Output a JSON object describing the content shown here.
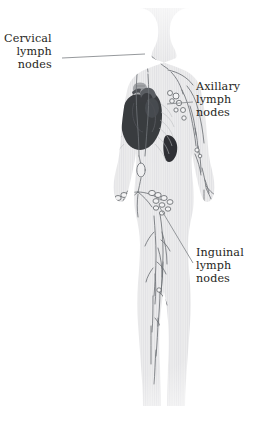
{
  "diagram": {
    "background_color": "#ffffff",
    "body_fill_color": "#ececed",
    "body_stripe_color": "#e2e2e4",
    "vessel_color": "#6f7377",
    "node_stroke_color": "#6f7377",
    "node_fill_color": "#f2f2f3",
    "organ_heart_color": "#3a3c40",
    "organ_spleen_color": "#2f3135",
    "leader_line_color": "#8a8d91",
    "text_color": "#1f1f22"
  },
  "labels": [
    {
      "id": "cervical",
      "name": "cervical-lymph-nodes",
      "align": "right",
      "lines": [
        "Cervical",
        "lymph",
        "nodes"
      ],
      "leader": {
        "x1": 62,
        "y1": 58,
        "x2": 145,
        "y2": 54
      }
    },
    {
      "id": "axillary",
      "name": "axillary-lymph-nodes",
      "align": "left",
      "lines": [
        "Axillary",
        "lymph",
        "nodes"
      ],
      "leader": {
        "x1": 193,
        "y1": 102,
        "x2": 167,
        "y2": 104
      }
    },
    {
      "id": "inguinal",
      "name": "inguinal-lymph-nodes",
      "align": "left",
      "lines": [
        "Inguinal",
        "lymph",
        "nodes"
      ],
      "leader": {
        "x1": 193,
        "y1": 263,
        "x2": 159,
        "y2": 206
      }
    }
  ],
  "anatomy": {
    "regions": [
      "head",
      "neck",
      "shoulders",
      "thorax",
      "abdomen",
      "pelvis",
      "arms",
      "hands",
      "legs",
      "feet"
    ],
    "organs": [
      "heart",
      "spleen",
      "thymus",
      "cisterna-chyli"
    ],
    "node_groups": [
      "cervical-lymph-nodes",
      "axillary-lymph-nodes",
      "inguinal-lymph-nodes",
      "cubital-lymph-nodes",
      "popliteal-lymph-nodes"
    ]
  }
}
